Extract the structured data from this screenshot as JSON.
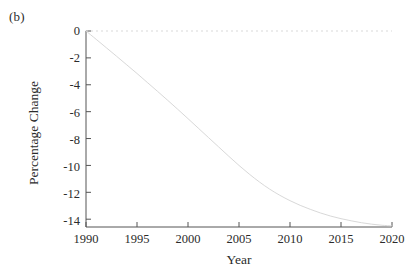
{
  "figure": {
    "panel_label": "(b)",
    "background_color": "#ffffff"
  },
  "chart_data": {
    "type": "line",
    "title": "",
    "subtitle": "",
    "xlabel": "Year",
    "ylabel": "Percentage Change",
    "xlim": [
      1990,
      2020
    ],
    "ylim": [
      -15,
      0
    ],
    "xticks": [
      1990,
      1995,
      2000,
      2005,
      2010,
      2015,
      2020
    ],
    "xtick_labels": [
      "1990",
      "1995",
      "2000",
      "2005",
      "2010",
      "2015",
      "2020"
    ],
    "yticks": [
      0,
      -2,
      -4,
      -6,
      -8,
      -10,
      -12,
      -14
    ],
    "ytick_labels": [
      "0",
      "-2",
      "-4",
      "-6",
      "-8",
      "-10",
      "-12",
      "-14"
    ],
    "grid": false,
    "legend": null,
    "legend_position": "none",
    "line_color": "#d4d4d4",
    "line_width": 0.9,
    "zero_reference_line": {
      "value": 0,
      "style": "dotted",
      "color": "#d9d9d9"
    },
    "x": [
      1990,
      1991,
      1992,
      1993,
      1994,
      1995,
      1996,
      1997,
      1998,
      1999,
      2000,
      2001,
      2002,
      2003,
      2004,
      2005,
      2006,
      2007,
      2008,
      2009,
      2010,
      2011,
      2012,
      2013,
      2014,
      2015,
      2016,
      2017,
      2018,
      2019,
      2020
    ],
    "values": [
      0.0,
      -0.62,
      -1.25,
      -1.88,
      -2.52,
      -3.16,
      -3.82,
      -4.48,
      -5.15,
      -5.83,
      -6.52,
      -7.22,
      -7.92,
      -8.62,
      -9.32,
      -10.0,
      -10.64,
      -11.23,
      -11.76,
      -12.22,
      -12.62,
      -12.97,
      -13.27,
      -13.54,
      -13.77,
      -13.96,
      -14.12,
      -14.26,
      -14.37,
      -14.45,
      -14.5
    ],
    "series": [
      {
        "name": "Percentage Change",
        "values": [
          0.0,
          -0.62,
          -1.25,
          -1.88,
          -2.52,
          -3.16,
          -3.82,
          -4.48,
          -5.15,
          -5.83,
          -6.52,
          -7.22,
          -7.92,
          -8.62,
          -9.32,
          -10.0,
          -10.64,
          -11.23,
          -11.76,
          -12.22,
          -12.62,
          -12.97,
          -13.27,
          -13.54,
          -13.77,
          -13.96,
          -14.12,
          -14.26,
          -14.37,
          -14.45,
          -14.5
        ]
      }
    ]
  }
}
